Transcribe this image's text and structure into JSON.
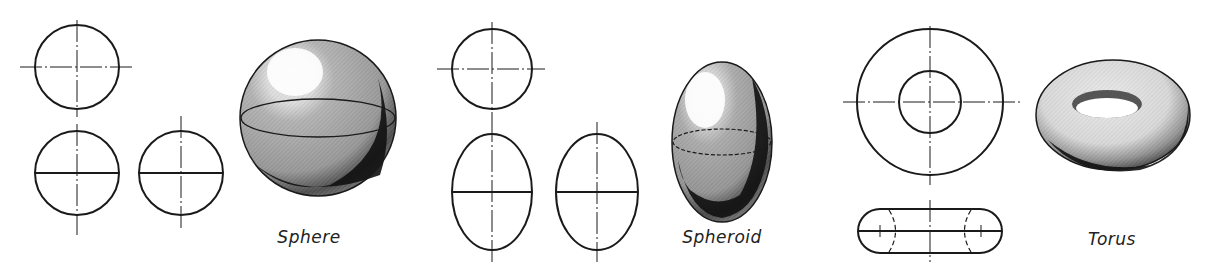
{
  "figure": {
    "groups": [
      {
        "id": "sphere",
        "label": "Sphere",
        "views": [
          "top-view-circle",
          "front-view-circle",
          "side-view-circle",
          "pictorial-sphere"
        ]
      },
      {
        "id": "spheroid",
        "label": "Spheroid",
        "views": [
          "top-view-circle",
          "front-view-ellipse",
          "side-view-ellipse",
          "pictorial-spheroid"
        ]
      },
      {
        "id": "torus",
        "label": "Torus",
        "views": [
          "top-view-concentric-circles",
          "front-view-rounded",
          "pictorial-torus"
        ]
      }
    ]
  },
  "colors": {
    "line": "#1a1a1a",
    "shade_dark": "#111111",
    "shade_mid": "#8a8a8a",
    "highlight": "#ffffff"
  }
}
